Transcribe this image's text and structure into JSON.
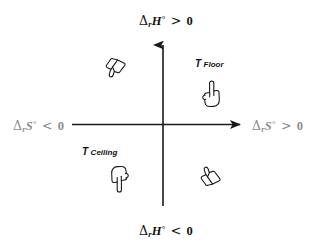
{
  "diagram": {
    "background_color": "#ffffff",
    "axis_color": "#1a1a1a",
    "label_color": "#111111",
    "gray_label_color": "#8d8d8d"
  },
  "axes": {
    "vertical": {
      "name": "enthalpy-axis",
      "quantity": "ΔrH°",
      "arrow": "up",
      "top_label": {
        "delta": "Δ",
        "sub": "r",
        "symbol": "H",
        "degree": "°",
        "relation": ">",
        "value": "0",
        "text": "ΔrH° > 0"
      },
      "bottom_label": {
        "delta": "Δ",
        "sub": "r",
        "symbol": "H",
        "degree": "°",
        "relation": "<",
        "value": "0",
        "text": "ΔrH° < 0"
      }
    },
    "horizontal": {
      "name": "entropy-axis",
      "quantity": "ΔrS°",
      "arrow": "right",
      "left_label": {
        "delta": "Δ",
        "sub": "r",
        "symbol": "S",
        "degree": "°",
        "relation": "<",
        "value": "0",
        "text": "ΔrS° < 0"
      },
      "right_label": {
        "delta": "Δ",
        "sub": "r",
        "symbol": "S",
        "degree": "°",
        "relation": ">",
        "value": "0",
        "text": "ΔrS° > 0"
      }
    }
  },
  "annotations": [
    {
      "id": "t-floor",
      "symbol": "T",
      "subscript": "Floor",
      "text": "T Floor",
      "quadrant": "upper-right"
    },
    {
      "id": "t-ceiling",
      "symbol": "T",
      "subscript": "Ceiling",
      "text": "T Ceiling",
      "quadrant": "lower-left"
    }
  ],
  "hand_icons": [
    {
      "id": "hand-upper-left",
      "icon": "thumbs-down-icon",
      "quadrant": "upper-left",
      "meaning": "non-spontaneous"
    },
    {
      "id": "hand-upper-right",
      "icon": "pointing-up-finger-icon",
      "quadrant": "upper-right",
      "meaning": "spontaneous above T Floor"
    },
    {
      "id": "hand-lower-left",
      "icon": "pointing-down-finger-icon",
      "quadrant": "lower-left",
      "meaning": "spontaneous below T Ceiling"
    },
    {
      "id": "hand-lower-right",
      "icon": "thumbs-up-icon",
      "quadrant": "lower-right",
      "meaning": "always spontaneous"
    }
  ]
}
